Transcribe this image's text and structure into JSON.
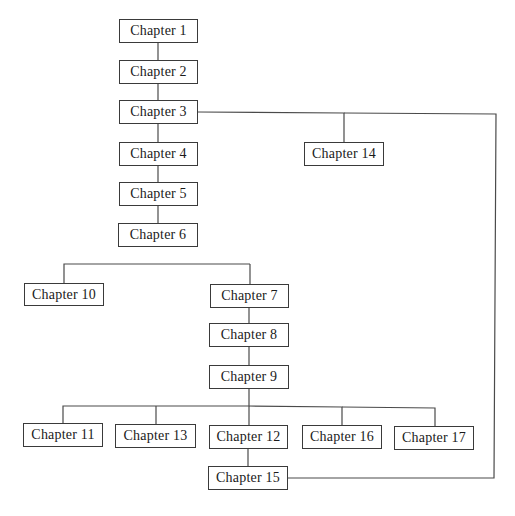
{
  "diagram": {
    "type": "chapter-dependency-tree",
    "line_color": "#4a4a4a",
    "box_border_color": "#3a3a3a",
    "nodes": [
      {
        "id": "ch1",
        "label": "Chapter 1",
        "x": 119,
        "y": 19,
        "w": 79,
        "h": 24
      },
      {
        "id": "ch2",
        "label": "Chapter 2",
        "x": 119,
        "y": 60,
        "w": 79,
        "h": 24
      },
      {
        "id": "ch3",
        "label": "Chapter 3",
        "x": 119,
        "y": 100,
        "w": 79,
        "h": 24
      },
      {
        "id": "ch4",
        "label": "Chapter 4",
        "x": 119,
        "y": 142,
        "w": 79,
        "h": 24
      },
      {
        "id": "ch5",
        "label": "Chapter 5",
        "x": 119,
        "y": 182,
        "w": 79,
        "h": 24
      },
      {
        "id": "ch6",
        "label": "Chapter 6",
        "x": 118,
        "y": 223,
        "w": 80,
        "h": 24
      },
      {
        "id": "ch14",
        "label": "Chapter 14",
        "x": 304,
        "y": 142,
        "w": 80,
        "h": 24
      },
      {
        "id": "ch10",
        "label": "Chapter 10",
        "x": 24,
        "y": 283,
        "w": 80,
        "h": 23
      },
      {
        "id": "ch7",
        "label": "Chapter 7",
        "x": 210,
        "y": 284,
        "w": 79,
        "h": 24
      },
      {
        "id": "ch8",
        "label": "Chapter 8",
        "x": 209,
        "y": 323,
        "w": 80,
        "h": 24
      },
      {
        "id": "ch9",
        "label": "Chapter 9",
        "x": 209,
        "y": 365,
        "w": 80,
        "h": 24
      },
      {
        "id": "ch11",
        "label": "Chapter 11",
        "x": 23,
        "y": 423,
        "w": 80,
        "h": 24
      },
      {
        "id": "ch13",
        "label": "Chapter 13",
        "x": 115,
        "y": 424,
        "w": 81,
        "h": 24
      },
      {
        "id": "ch12",
        "label": "Chapter 12",
        "x": 209,
        "y": 425,
        "w": 79,
        "h": 24
      },
      {
        "id": "ch16",
        "label": "Chapter 16",
        "x": 302,
        "y": 425,
        "w": 80,
        "h": 24
      },
      {
        "id": "ch17",
        "label": "Chapter 17",
        "x": 394,
        "y": 426,
        "w": 80,
        "h": 24
      },
      {
        "id": "ch15",
        "label": "Chapter 15",
        "x": 208,
        "y": 466,
        "w": 80,
        "h": 24
      }
    ],
    "edges": [
      {
        "from": "ch1",
        "to": "ch2",
        "points": "158,43 158,60"
      },
      {
        "from": "ch2",
        "to": "ch3",
        "points": "158,84 158,100"
      },
      {
        "from": "ch3",
        "to": "ch4",
        "points": "158,124 158,142"
      },
      {
        "from": "ch4",
        "to": "ch5",
        "points": "158,166 158,182"
      },
      {
        "from": "ch5",
        "to": "ch6",
        "points": "158,206 158,223"
      },
      {
        "from": "ch3",
        "to": "ch14",
        "points": "198,112 344,113 344,142"
      },
      {
        "from": "ch3",
        "to": "ch15",
        "points": "344,113 496,114 494,478 288,478"
      },
      {
        "from": "ch6",
        "to": "ch10",
        "points": "250,264 64,264 64,283"
      },
      {
        "from": "ch6",
        "to": "ch7",
        "points": "250,264 250,284"
      },
      {
        "from": "ch7",
        "to": "ch8",
        "points": "249,308 249,323"
      },
      {
        "from": "ch8",
        "to": "ch9",
        "points": "249,347 249,365"
      },
      {
        "from": "ch9",
        "to": "ch11",
        "points": "249,389 249,406 63,406 63,423"
      },
      {
        "from": "ch9",
        "to": "ch13",
        "points": "156,406 156,424"
      },
      {
        "from": "ch9",
        "to": "ch12",
        "points": "249,406 249,425"
      },
      {
        "from": "ch9",
        "to": "ch16",
        "points": "249,406 342,407 342,425"
      },
      {
        "from": "ch9",
        "to": "ch17",
        "points": "342,407 435,408 435,426"
      },
      {
        "from": "ch12",
        "to": "ch15",
        "points": "248,449 248,466"
      }
    ]
  }
}
